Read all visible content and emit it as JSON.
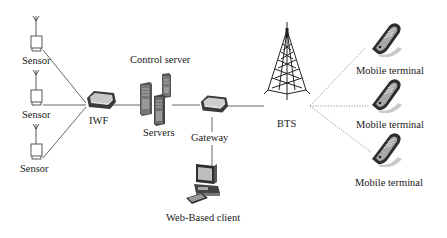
{
  "diagram": {
    "type": "network-architecture",
    "colors": {
      "line": "#555555",
      "device_dark": "#3a3a3a",
      "device_mid": "#8a8a8a",
      "device_light": "#d8d8d8",
      "background": "#ffffff"
    },
    "nodes": {
      "sensor_1": {
        "label": "Sensor"
      },
      "sensor_2": {
        "label": "Sensor"
      },
      "sensor_3": {
        "label": "Sensor"
      },
      "iwf": {
        "label": "IWF"
      },
      "control_server": {
        "label": "Control server"
      },
      "servers": {
        "label": "Servers"
      },
      "gateway": {
        "label": "Gateway"
      },
      "web_client": {
        "label": "Web-Based client"
      },
      "bts": {
        "label": "BTS"
      },
      "mobile_1": {
        "label": "Mobile terminal"
      },
      "mobile_2": {
        "label": "Mobile terminal"
      },
      "mobile_3": {
        "label": "Mobile terminal"
      }
    },
    "edges": [
      {
        "from": "sensor_1",
        "to": "iwf",
        "style": "solid"
      },
      {
        "from": "sensor_2",
        "to": "iwf",
        "style": "solid"
      },
      {
        "from": "sensor_3",
        "to": "iwf",
        "style": "solid"
      },
      {
        "from": "iwf",
        "to": "servers",
        "style": "solid"
      },
      {
        "from": "servers",
        "to": "gateway",
        "style": "solid"
      },
      {
        "from": "gateway",
        "to": "web_client",
        "style": "solid"
      },
      {
        "from": "gateway",
        "to": "bts",
        "style": "solid"
      },
      {
        "from": "bts",
        "to": "mobile_1",
        "style": "dotted"
      },
      {
        "from": "bts",
        "to": "mobile_2",
        "style": "dotted"
      },
      {
        "from": "bts",
        "to": "mobile_3",
        "style": "dotted"
      }
    ]
  }
}
